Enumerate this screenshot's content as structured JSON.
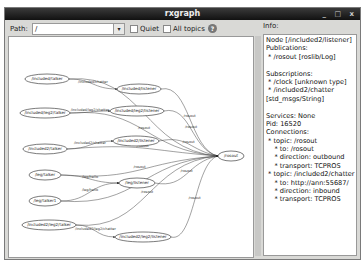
{
  "window": {
    "title": "rxgraph",
    "controls": [
      "_",
      "□",
      "x"
    ]
  },
  "toolbar": {
    "path_label": "Path:",
    "path_value": "/",
    "quiet_label": "Quiet",
    "quiet_checked": false,
    "all_topics_label": "All topics",
    "all_topics_checked": false,
    "help_icon": "help-icon"
  },
  "info": {
    "label": "Info:",
    "lines": [
      "Node [/included2/listener]",
      "Publications:",
      " * /rosout [roslib/Log]",
      "",
      "Subscriptions:",
      " * /clock [unknown type]",
      " * /included2/chatter",
      "[std_msgs/String]",
      "",
      "Services: None",
      "Pid: 16520",
      "Connections:",
      " * topic: /rosout",
      "    * to: /rosout",
      "    * direction: outbound",
      "    * transport: TCPROS",
      " * topic: /included2/chatter",
      "    * to: http://ann:55687/",
      "    * direction: inbound",
      "    * transport: TCPROS"
    ]
  },
  "graph": {
    "nodes": [
      {
        "id": "included_talker",
        "label": "/included/talker",
        "x": 38,
        "y": 42,
        "rx": 22
      },
      {
        "id": "included_listener",
        "label": "/included/listener",
        "x": 130,
        "y": 52,
        "rx": 22
      },
      {
        "id": "included_leg2_talker",
        "label": "/included/leg2/talker",
        "x": 36,
        "y": 76,
        "rx": 25
      },
      {
        "id": "included_leg2_listener",
        "label": "/included/leg2/listener",
        "x": 128,
        "y": 74,
        "rx": 27
      },
      {
        "id": "included2_talker",
        "label": "/included2/talker",
        "x": 36,
        "y": 112,
        "rx": 22
      },
      {
        "id": "included2_listener",
        "label": "/included2/listener",
        "x": 127,
        "y": 104,
        "rx": 23
      },
      {
        "id": "rosout",
        "label": "/rosout",
        "x": 222,
        "y": 119,
        "rx": 13
      },
      {
        "id": "leg_talker",
        "label": "/leg/talker",
        "x": 36,
        "y": 138,
        "rx": 16
      },
      {
        "id": "leg_listener",
        "label": "/leg/listener",
        "x": 128,
        "y": 146,
        "rx": 18
      },
      {
        "id": "leg_talker1",
        "label": "/leg/talker1",
        "x": 36,
        "y": 164,
        "rx": 16
      },
      {
        "id": "included2_leg2_talker",
        "label": "/included2/leg2/talker",
        "x": 40,
        "y": 188,
        "rx": 27
      },
      {
        "id": "included2_leg2_listener",
        "label": "/included2/leg2/listener",
        "x": 134,
        "y": 200,
        "rx": 28
      }
    ],
    "edges": [
      {
        "from": "included_talker",
        "to": "included_listener",
        "label": "/included/chatter"
      },
      {
        "from": "included_talker",
        "to": "rosout",
        "label": "/rosout"
      },
      {
        "from": "included_listener",
        "to": "rosout",
        "label": "/rosout"
      },
      {
        "from": "included_leg2_talker",
        "to": "included_leg2_listener",
        "label": "/included/leg2/chatter"
      },
      {
        "from": "included_leg2_talker",
        "to": "rosout",
        "label": "/rosout"
      },
      {
        "from": "included_leg2_listener",
        "to": "rosout",
        "label": "/rosout"
      },
      {
        "from": "included2_talker",
        "to": "included2_listener",
        "label": "/included2/chatter"
      },
      {
        "from": "included2_talker",
        "to": "rosout",
        "label": "/rosout"
      },
      {
        "from": "included2_listener",
        "to": "rosout",
        "label": "/rosout"
      },
      {
        "from": "leg_talker",
        "to": "leg_listener",
        "label": "/leg/hello"
      },
      {
        "from": "leg_talker",
        "to": "rosout",
        "label": "/rosout"
      },
      {
        "from": "leg_talker1",
        "to": "leg_listener",
        "label": "/leg/hello"
      },
      {
        "from": "leg_listener",
        "to": "rosout",
        "label": "/rosout"
      },
      {
        "from": "leg_talker1",
        "to": "rosout",
        "label": "/rosout"
      },
      {
        "from": "included2_leg2_talker",
        "to": "included2_leg2_listener",
        "label": "/included2/leg2/chatter"
      },
      {
        "from": "included2_leg2_talker",
        "to": "rosout",
        "label": "/rosout"
      },
      {
        "from": "included2_leg2_listener",
        "to": "rosout",
        "label": "/rosout"
      }
    ]
  }
}
